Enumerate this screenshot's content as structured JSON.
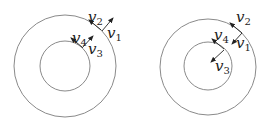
{
  "figures": [
    {
      "id": "left",
      "outer_circle": {
        "cx": 65,
        "cy": 66,
        "r": 51
      },
      "inner_circle": {
        "cx": 65,
        "cy": 66,
        "r": 25
      },
      "vectors": [
        {
          "name": "v1",
          "symbol": "v",
          "sub": "1",
          "direction": "radial-outward",
          "x1": 102,
          "y1": 31,
          "x2": 113,
          "y2": 18,
          "label_x": 107,
          "label_y": 38
        },
        {
          "name": "v2",
          "symbol": "v",
          "sub": "2",
          "direction": "tangential",
          "x1": 101,
          "y1": 30,
          "x2": 89,
          "y2": 20,
          "label_x": 88,
          "label_y": 22
        },
        {
          "name": "v3",
          "symbol": "v",
          "sub": "3",
          "direction": "radial-outward",
          "x1": 82,
          "y1": 48,
          "x2": 93,
          "y2": 36,
          "label_x": 88,
          "label_y": 54
        },
        {
          "name": "v4",
          "symbol": "v",
          "sub": "4",
          "direction": "tangential",
          "x1": 82,
          "y1": 47,
          "x2": 71,
          "y2": 38,
          "label_x": 72,
          "label_y": 43
        }
      ]
    },
    {
      "id": "right",
      "outer_circle": {
        "cx": 208,
        "cy": 67,
        "r": 48
      },
      "inner_circle": {
        "cx": 208,
        "cy": 66,
        "r": 24
      },
      "vectors": [
        {
          "name": "v1",
          "symbol": "v",
          "sub": "1",
          "direction": "radial-inward",
          "x1": 242,
          "y1": 33,
          "x2": 232,
          "y2": 44,
          "label_x": 236,
          "label_y": 48
        },
        {
          "name": "v2",
          "symbol": "v",
          "sub": "2",
          "direction": "tangential",
          "x1": 242,
          "y1": 33,
          "x2": 230,
          "y2": 23,
          "label_x": 236,
          "label_y": 22
        },
        {
          "name": "v3",
          "symbol": "v",
          "sub": "3",
          "direction": "radial-inward",
          "x1": 224,
          "y1": 50,
          "x2": 211,
          "y2": 62,
          "label_x": 215,
          "label_y": 71
        },
        {
          "name": "v4",
          "symbol": "v",
          "sub": "4",
          "direction": "tangential",
          "x1": 224,
          "y1": 49,
          "x2": 212,
          "y2": 39,
          "label_x": 214,
          "label_y": 40
        }
      ]
    }
  ]
}
